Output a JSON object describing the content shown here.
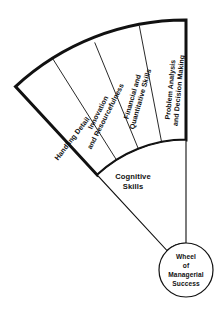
{
  "diagram": {
    "title": "Wheel of Managerial Success",
    "type": "fan-wedge-segment-diagram",
    "hub": {
      "name": "hub-circle",
      "lines": [
        "Wheel",
        "of",
        "Managerial",
        "Success"
      ],
      "center_x": 186,
      "center_y": 270,
      "radius": 27
    },
    "cognitive_band": {
      "name": "cognitive-skills-band",
      "lines": [
        "Cognitive",
        "Skills"
      ],
      "label_x": 133,
      "label_y": 176
    },
    "geometry": {
      "center_x": 186,
      "center_y": 270,
      "inner_radius": 130,
      "outer_radius": 250,
      "start_angle_deg": 90,
      "end_angle_deg": 133,
      "segment_count": 4
    },
    "segments": [
      {
        "id": "problem-analysis",
        "lines": [
          "Problem Analysis",
          "and Decision Making"
        ],
        "index": 0
      },
      {
        "id": "financial-quantitative",
        "lines": [
          "Financial and",
          "Quantitative Skills"
        ],
        "index": 1
      },
      {
        "id": "innovation-resourcefulness",
        "lines": [
          "Innovation",
          "and Resourcefulness"
        ],
        "index": 2
      },
      {
        "id": "handling-detail",
        "lines": [
          "Handling Detail"
        ],
        "index": 3
      }
    ],
    "colors": {
      "stroke": "#111111",
      "fill": "#ffffff",
      "background": "#ffffff",
      "text": "#111111"
    },
    "strokes": {
      "outer_border_width": 3.0,
      "divider_width": 0.8,
      "hub_width": 1.2
    }
  }
}
